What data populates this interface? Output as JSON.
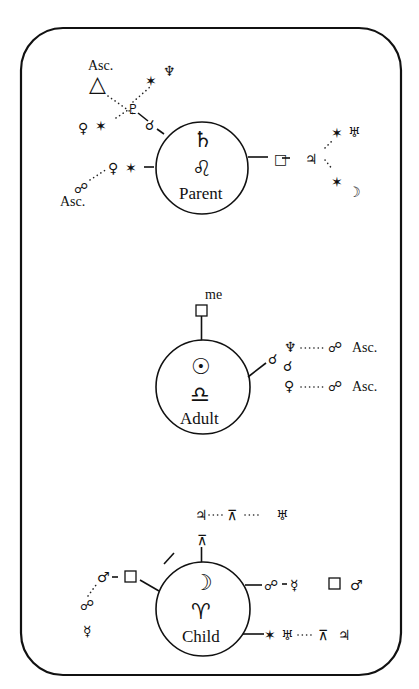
{
  "colors": {
    "ink": "#111111",
    "background": "#ffffff"
  },
  "parent": {
    "label": "Parent",
    "planet": "♄",
    "sign": "♌",
    "upper_left": {
      "asc_label": "Asc.",
      "trine": "△",
      "pluto": "♇",
      "sextile_1": "✶",
      "neptune": "♆",
      "sextile_2": "✶",
      "venus": "♀",
      "conjunction": "☌"
    },
    "lower_left": {
      "opposition": "☍",
      "asc_label": "Asc.",
      "venus": "♀",
      "sextile": "✶"
    },
    "right": {
      "square": "□",
      "jupiter": "♃",
      "sextile_1": "✶",
      "uranus": "♅",
      "sextile_2": "✶",
      "moon": "☽"
    }
  },
  "adult": {
    "label": "Adult",
    "top_label": "me",
    "planet": "☉",
    "sign": "♎",
    "right": {
      "conjunction_1": "☌",
      "conjunction_2": "☌",
      "neptune": "♆",
      "opposition_1": "☍",
      "asc_1": "Asc.",
      "venus": "♀",
      "opposition_2": "☍",
      "asc_2": "Asc."
    }
  },
  "child": {
    "label": "Child",
    "planet": "☽",
    "sign": "♈",
    "top": {
      "quincunx": "⊼",
      "jupiter": "♃",
      "quincunx_2": "⊼",
      "uranus": "♅"
    },
    "left": {
      "square": "□",
      "mars": "♂",
      "opposition": "☍",
      "mercury": "☿"
    },
    "right_upper": {
      "opposition": "☍",
      "mercury": "☿",
      "square": "□",
      "mars": "♂"
    },
    "right_lower": {
      "sextile": "✶",
      "uranus": "♅",
      "quincunx": "⊼",
      "jupiter": "♃"
    }
  }
}
